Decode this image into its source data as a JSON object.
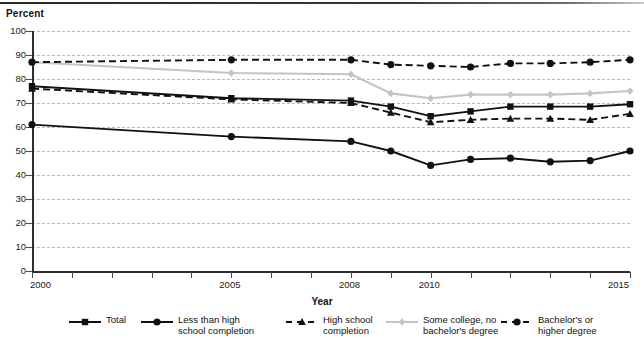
{
  "axis": {
    "y_title": "Percent",
    "x_title": "Year",
    "y_ticks": [
      "0",
      "10",
      "20",
      "30",
      "40",
      "50",
      "60",
      "70",
      "80",
      "90",
      "100"
    ],
    "x_ticks": [
      {
        "year": 2000,
        "label": "2000"
      },
      {
        "year": 2001,
        "label": ""
      },
      {
        "year": 2002,
        "label": ""
      },
      {
        "year": 2003,
        "label": ""
      },
      {
        "year": 2004,
        "label": ""
      },
      {
        "year": 2005,
        "label": "2005"
      },
      {
        "year": 2006,
        "label": ""
      },
      {
        "year": 2007,
        "label": ""
      },
      {
        "year": 2008,
        "label": "2008"
      },
      {
        "year": 2009,
        "label": ""
      },
      {
        "year": 2010,
        "label": "2010"
      },
      {
        "year": 2011,
        "label": ""
      },
      {
        "year": 2012,
        "label": ""
      },
      {
        "year": 2013,
        "label": ""
      },
      {
        "year": 2014,
        "label": ""
      },
      {
        "year": 2015,
        "label": "2015"
      }
    ]
  },
  "legend": [
    {
      "label": "Total",
      "marker": "square",
      "dash": "solid",
      "color": "#111111"
    },
    {
      "label": "Less than high\nschool completion",
      "marker": "circle",
      "dash": "solid",
      "color": "#111111"
    },
    {
      "label": "High school\ncompletion",
      "marker": "triangle",
      "dash": "dashed",
      "color": "#111111"
    },
    {
      "label": "Some college, no\nbachelor's degree",
      "marker": "diamond",
      "dash": "solid",
      "color": "#c4c4c4"
    },
    {
      "label": "Bachelor's or\nhigher degree",
      "marker": "circle",
      "dash": "dashed",
      "color": "#111111"
    }
  ],
  "chart_data": {
    "type": "line",
    "title": "",
    "xlabel": "Year",
    "ylabel": "Percent",
    "xlim": [
      2000,
      2015
    ],
    "ylim": [
      0,
      100
    ],
    "grid": true,
    "legend_position": "bottom",
    "x": [
      2000,
      2005,
      2008,
      2009,
      2010,
      2011,
      2012,
      2013,
      2014,
      2015
    ],
    "series": [
      {
        "name": "Total",
        "marker": "square",
        "dash": "solid",
        "color": "#111111",
        "values": [
          77,
          72,
          71,
          68.5,
          64.5,
          66.5,
          68.5,
          68.5,
          68.5,
          69.5
        ]
      },
      {
        "name": "Less than high school completion",
        "marker": "circle",
        "dash": "solid",
        "color": "#111111",
        "values": [
          61,
          56,
          54,
          50,
          44,
          46.5,
          47,
          45.5,
          46,
          50
        ]
      },
      {
        "name": "High school completion",
        "marker": "triangle",
        "dash": "dashed",
        "color": "#111111",
        "values": [
          76,
          71.5,
          70,
          66,
          62,
          63,
          63.5,
          63.5,
          63,
          65.5
        ]
      },
      {
        "name": "Some college, no bachelor's degree",
        "marker": "diamond",
        "dash": "solid",
        "color": "#c4c4c4",
        "values": [
          87,
          82.5,
          82,
          74,
          72,
          73.5,
          73.5,
          73.5,
          74,
          75
        ]
      },
      {
        "name": "Bachelor's or higher degree",
        "marker": "circle",
        "dash": "dashed",
        "color": "#111111",
        "values": [
          87,
          88,
          88,
          86,
          85.5,
          85,
          86.5,
          86.5,
          87,
          88
        ]
      }
    ]
  }
}
